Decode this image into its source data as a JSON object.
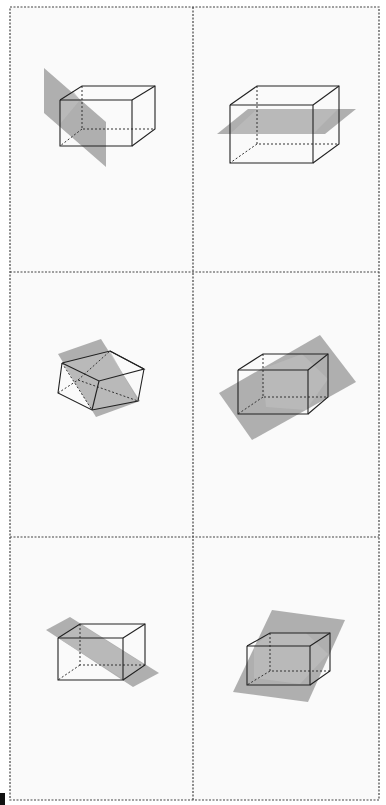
{
  "figure": {
    "grid": {
      "left": 10,
      "right": 379,
      "top": 7,
      "bottom": 800,
      "col_divider": 193,
      "row_dividers": [
        272,
        537
      ]
    },
    "colors": {
      "background": "#ffffff",
      "cell": "#fafafa",
      "plane": "#9c9c9c",
      "section": "#bcbcbc",
      "edge": "#222222"
    },
    "panels": [
      {
        "id": "panel-1",
        "planes": [
          "44,68 106,122 106,167 44,113"
        ],
        "sections": [
          "60,102 73,91 80,100 60,124"
        ],
        "edges": [
          "60,100 132,100 132,146 60,146 60,100",
          "60,100 82,86 155,86 155,129 132,146",
          "132,100 155,86"
        ],
        "hidden": [
          "82,86 82,129 155,129",
          "82,129 60,146"
        ]
      },
      {
        "id": "panel-2",
        "planes": [
          "217,134 248,109 356,109 325,134"
        ],
        "sections": [
          "230,134 257,109 338,109 313,134"
        ],
        "edges": [
          "230,105 313,105 313,163 230,163 230,105",
          "230,105 257,86 339,86 339,144 313,163",
          "313,105 339,86"
        ],
        "hidden": [
          "257,86 257,144 339,144",
          "257,144 230,163"
        ]
      },
      {
        "id": "panel-3",
        "planes": [
          "58,354 101,339 140,401 96,417"
        ],
        "sections": [
          "62,363 110,351 138,401 92,410"
        ],
        "edges": [
          "62,363 110,351 144,369 99,381 62,363",
          "62,363 58,393 92,410 138,401 144,369",
          "99,381 92,410",
          "110,351 144,369"
        ],
        "hidden": [
          "58,393 78,380 138,401",
          "78,380 110,351",
          "62,363 92,410"
        ]
      },
      {
        "id": "panel-4",
        "planes": [
          "219,393 320,335 356,382 252,440"
        ],
        "sections": [
          "262,369 302,354 328,379 306,410 266,407"
        ],
        "edges": [
          "238,370 308,370 308,414 238,414 238,370",
          "238,370 263,354 328,354 328,397 308,414",
          "308,370 328,354"
        ],
        "hidden": [
          "263,354 263,397 328,397",
          "263,397 238,414"
        ]
      },
      {
        "id": "panel-5",
        "planes": [
          "46,630 70,617 159,673 133,687"
        ],
        "sections": [
          "58,638 80,624 145,665 123,679"
        ],
        "edges": [
          "58,638 123,638 123,680 58,680 58,638",
          "58,638 80,624 145,624 145,665 123,680",
          "123,638 145,624"
        ],
        "hidden": [
          "80,624 80,665 145,665",
          "80,665 58,680"
        ]
      },
      {
        "id": "panel-6",
        "planes": [
          "272,610 345,620 308,702 233,692"
        ],
        "sections": [
          "254,646 270,633 306,633 328,654 300,684 254,678"
        ],
        "edges": [
          "247,646 310,646 310,685 247,685 247,646",
          "247,646 270,633 330,633 330,671 310,685",
          "310,646 330,633"
        ],
        "hidden": [
          "270,633 270,671 330,671",
          "270,671 247,685"
        ]
      }
    ],
    "corner_mark": "0,793 5,793 5,805 0,805"
  }
}
